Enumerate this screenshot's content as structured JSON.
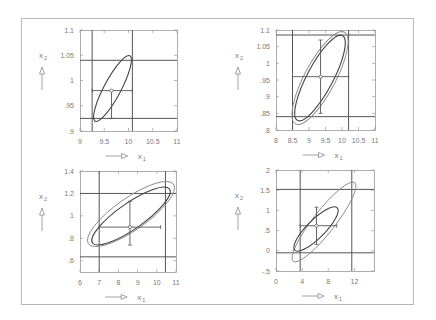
{
  "figure": {
    "border_color": "#b8b8b8",
    "line_color": "#555555",
    "ellipse_outer_color": "#8a8a8a",
    "ellipse_inner_color": "#444444",
    "xlabel": "x",
    "xlabel_sub": "1",
    "ylabel": "x",
    "ylabel_sub": "2"
  },
  "chart_data": [
    {
      "type": "scatter",
      "title": "",
      "xlabel": "x1",
      "ylabel": "x2",
      "xlim": [
        9,
        11
      ],
      "ylim": [
        0.9,
        1.1
      ],
      "xticks": [
        "9",
        "9.5",
        "10",
        "10.5",
        "11"
      ],
      "yticks": [
        "1.1",
        "1.05",
        "1",
        ".95",
        ".9"
      ],
      "center": [
        9.65,
        0.98
      ],
      "vlines": [
        9.25,
        10.08
      ],
      "hlines": [
        1.04,
        0.925
      ],
      "errorbar_x": [
        9.25,
        10.08
      ],
      "errorbar_y": [
        0.925,
        0.98
      ],
      "ellipses": [
        {
          "cx": 9.67,
          "cy": 0.982,
          "rx_deg_span": "rotated",
          "tilt": 62,
          "a": 0.3,
          "b": 0.05
        }
      ],
      "grid": false
    },
    {
      "type": "scatter",
      "title": "",
      "xlabel": "x1",
      "ylabel": "x2",
      "xlim": [
        8,
        11
      ],
      "ylim": [
        0.8,
        1.1
      ],
      "xticks": [
        "8",
        "8.5",
        "9",
        "9.5",
        "10",
        "10.5",
        "11"
      ],
      "yticks": [
        "1.1",
        "1.05",
        "1",
        ".95",
        ".9",
        ".85",
        ".8"
      ],
      "center": [
        9.35,
        0.96
      ],
      "vlines": [
        8.5,
        10.2
      ],
      "hlines": [
        1.085,
        0.84
      ],
      "errorbar_x": [
        8.5,
        10.2
      ],
      "errorbar_y": [
        0.85,
        1.07
      ],
      "ellipses": [
        {
          "label": "outer",
          "tilt": 62
        },
        {
          "label": "inner",
          "tilt": 62
        }
      ],
      "grid": false
    },
    {
      "type": "scatter",
      "title": "",
      "xlabel": "x1",
      "ylabel": "x2",
      "xlim": [
        6,
        11
      ],
      "ylim": [
        0.5,
        1.4
      ],
      "xticks": [
        "6",
        "7",
        "8",
        "9",
        "10",
        "11"
      ],
      "yticks": [
        "1.4",
        "1.2",
        "1",
        ".8",
        ".6"
      ],
      "center": [
        8.6,
        0.9
      ],
      "vlines": [
        7.0,
        10.45
      ],
      "hlines": [
        1.2,
        0.635
      ],
      "errorbar_x": [
        7.0,
        10.2
      ],
      "errorbar_y": [
        0.74,
        1.13
      ],
      "ellipses": [
        {
          "label": "outer",
          "tilt": 35
        },
        {
          "label": "inner",
          "tilt": 35
        }
      ],
      "grid": false
    },
    {
      "type": "scatter",
      "title": "",
      "xlabel": "x1",
      "ylabel": "x2",
      "xlim": [
        0,
        15
      ],
      "ylim": [
        -0.5,
        2
      ],
      "xticks": [
        "0",
        "4",
        "8",
        "12"
      ],
      "yticks": [
        "2",
        "1.5",
        "1",
        ".5",
        "0",
        "-.5"
      ],
      "center": [
        6.2,
        0.62
      ],
      "vlines": [
        3.7,
        11.6
      ],
      "hlines": [
        1.52,
        -0.05
      ],
      "errorbar_x": [
        3.7,
        9.3
      ],
      "errorbar_y": [
        0.16,
        1.08
      ],
      "ellipses": [
        {
          "label": "outer",
          "tilt": 50
        },
        {
          "label": "inner",
          "tilt": 45
        }
      ],
      "grid": false
    }
  ]
}
